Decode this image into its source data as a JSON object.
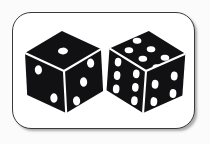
{
  "scene": {
    "title": "Two black dice on a white rounded card",
    "background_color": "#fbfbfb",
    "card": {
      "fill_color": "#ffffff",
      "border_color": "#3a3a3c",
      "corner_radius_px": 19,
      "shadow": "soft bottom-right drop shadow"
    }
  },
  "dice": [
    {
      "name": "left-die",
      "body_color": "#111113",
      "pip_color": "#ffffff",
      "seam_color": "#ffffff",
      "rotation_deg": -3,
      "faces": {
        "top": {
          "value": 1,
          "label": "one"
        },
        "left": {
          "value": 2,
          "label": "two"
        },
        "right": {
          "value": 3,
          "label": "three"
        }
      },
      "visible_pip_total": 6
    },
    {
      "name": "right-die",
      "body_color": "#111113",
      "pip_color": "#ffffff",
      "seam_color": "#ffffff",
      "rotation_deg": 4,
      "faces": {
        "top": {
          "value": 6,
          "label": "six"
        },
        "left": {
          "value": 6,
          "label": "six"
        },
        "right": {
          "value": 4,
          "label": "four"
        }
      },
      "visible_pip_total": 16
    }
  ],
  "totals": {
    "dice_count": 2,
    "top_faces_sum": 7
  }
}
